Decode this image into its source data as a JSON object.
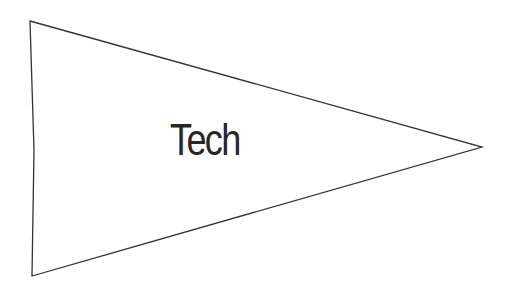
{
  "pennant": {
    "label": "Tech",
    "stroke_color": "#333333",
    "fill_color": "#ffffff",
    "text_color": "#262626"
  }
}
